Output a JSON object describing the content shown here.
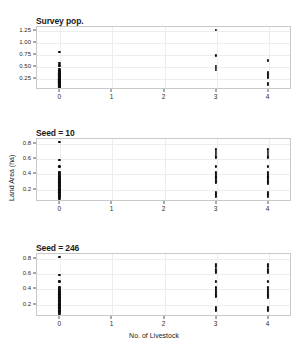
{
  "figure": {
    "xlabel": "No. of Livestock",
    "ylabel": "Land Area (ha)",
    "xticks": [
      "0",
      "1",
      "2",
      "3",
      "4"
    ],
    "background": "#ffffff",
    "point_color": "#0d0d0d",
    "grid_color": "#ededed",
    "frame_color": "#c9c9c9"
  },
  "chart_data": {
    "type": "scatter",
    "title": "",
    "xlabel": "No. of Livestock",
    "ylabel": "Land Area (ha)",
    "grid": true,
    "legend": "none",
    "xlim": [
      -0.45,
      4.45
    ],
    "xticks": [
      0,
      1,
      2,
      3,
      4
    ],
    "panels": [
      {
        "title": "Survey pop.",
        "ylim": [
          0.03,
          1.33
        ],
        "yticks": [
          0.25,
          0.5,
          0.75,
          1.0,
          1.25
        ],
        "ytick_labels": [
          "0.25",
          "0.50",
          "0.75",
          "1.00",
          "1.25"
        ],
        "points": [
          {
            "x": 0,
            "y": 0.8
          },
          {
            "x": 0,
            "y": 0.56
          },
          {
            "x": 0,
            "y": 0.53
          },
          {
            "x": 0,
            "y": 0.5
          },
          {
            "x": 0,
            "y": 0.44
          },
          {
            "x": 0,
            "y": 0.41
          },
          {
            "x": 0,
            "y": 0.4
          },
          {
            "x": 0,
            "y": 0.38
          },
          {
            "x": 0,
            "y": 0.36
          },
          {
            "x": 0,
            "y": 0.35
          },
          {
            "x": 0,
            "y": 0.34
          },
          {
            "x": 0,
            "y": 0.33
          },
          {
            "x": 0,
            "y": 0.32
          },
          {
            "x": 0,
            "y": 0.31
          },
          {
            "x": 0,
            "y": 0.3
          },
          {
            "x": 0,
            "y": 0.295
          },
          {
            "x": 0,
            "y": 0.285
          },
          {
            "x": 0,
            "y": 0.28
          },
          {
            "x": 0,
            "y": 0.27
          },
          {
            "x": 0,
            "y": 0.265
          },
          {
            "x": 0,
            "y": 0.26
          },
          {
            "x": 0,
            "y": 0.25
          },
          {
            "x": 0,
            "y": 0.245
          },
          {
            "x": 0,
            "y": 0.24
          },
          {
            "x": 0,
            "y": 0.235
          },
          {
            "x": 0,
            "y": 0.23
          },
          {
            "x": 0,
            "y": 0.225
          },
          {
            "x": 0,
            "y": 0.22
          },
          {
            "x": 0,
            "y": 0.215
          },
          {
            "x": 0,
            "y": 0.21
          },
          {
            "x": 0,
            "y": 0.205
          },
          {
            "x": 0,
            "y": 0.2
          },
          {
            "x": 0,
            "y": 0.195
          },
          {
            "x": 0,
            "y": 0.19
          },
          {
            "x": 0,
            "y": 0.185
          },
          {
            "x": 0,
            "y": 0.18
          },
          {
            "x": 0,
            "y": 0.175
          },
          {
            "x": 0,
            "y": 0.17
          },
          {
            "x": 0,
            "y": 0.165
          },
          {
            "x": 0,
            "y": 0.16
          },
          {
            "x": 0,
            "y": 0.155
          },
          {
            "x": 0,
            "y": 0.15
          },
          {
            "x": 0,
            "y": 0.145
          },
          {
            "x": 0,
            "y": 0.14
          },
          {
            "x": 0,
            "y": 0.135
          },
          {
            "x": 0,
            "y": 0.13
          },
          {
            "x": 0,
            "y": 0.125
          },
          {
            "x": 0,
            "y": 0.12
          },
          {
            "x": 0,
            "y": 0.115
          },
          {
            "x": 0,
            "y": 0.11
          },
          {
            "x": 0,
            "y": 0.105
          },
          {
            "x": 0,
            "y": 0.1
          },
          {
            "x": 0,
            "y": 0.095
          },
          {
            "x": 0,
            "y": 0.09
          },
          {
            "x": 0,
            "y": 0.085
          },
          {
            "x": 0,
            "y": 0.08
          },
          {
            "x": 0,
            "y": 0.075
          },
          {
            "x": 0,
            "y": 0.07
          },
          {
            "x": 3,
            "y": 1.25
          },
          {
            "x": 3,
            "y": 0.72
          },
          {
            "x": 3,
            "y": 0.5
          },
          {
            "x": 3,
            "y": 0.47
          },
          {
            "x": 3,
            "y": 0.42
          },
          {
            "x": 4,
            "y": 0.63
          },
          {
            "x": 4,
            "y": 0.61
          },
          {
            "x": 4,
            "y": 0.38
          },
          {
            "x": 4,
            "y": 0.36
          },
          {
            "x": 4,
            "y": 0.34
          },
          {
            "x": 4,
            "y": 0.32
          },
          {
            "x": 4,
            "y": 0.3
          },
          {
            "x": 4,
            "y": 0.28
          },
          {
            "x": 4,
            "y": 0.26
          },
          {
            "x": 4,
            "y": 0.16
          },
          {
            "x": 4,
            "y": 0.14
          },
          {
            "x": 4,
            "y": 0.12
          }
        ]
      },
      {
        "title": "Seed = 10",
        "ylim": [
          0.04,
          0.86
        ],
        "yticks": [
          0.2,
          0.4,
          0.6,
          0.8
        ],
        "ytick_labels": [
          "0.2",
          "0.4",
          "0.6",
          "0.8"
        ],
        "points": [
          {
            "x": 0,
            "y": 0.81
          },
          {
            "x": 0,
            "y": 0.57
          },
          {
            "x": 0,
            "y": 0.49
          },
          {
            "x": 0,
            "y": 0.42
          },
          {
            "x": 0,
            "y": 0.405
          },
          {
            "x": 0,
            "y": 0.39
          },
          {
            "x": 0,
            "y": 0.375
          },
          {
            "x": 0,
            "y": 0.36
          },
          {
            "x": 0,
            "y": 0.35
          },
          {
            "x": 0,
            "y": 0.34
          },
          {
            "x": 0,
            "y": 0.33
          },
          {
            "x": 0,
            "y": 0.32
          },
          {
            "x": 0,
            "y": 0.31
          },
          {
            "x": 0,
            "y": 0.3
          },
          {
            "x": 0,
            "y": 0.295
          },
          {
            "x": 0,
            "y": 0.29
          },
          {
            "x": 0,
            "y": 0.28
          },
          {
            "x": 0,
            "y": 0.27
          },
          {
            "x": 0,
            "y": 0.26
          },
          {
            "x": 0,
            "y": 0.25
          },
          {
            "x": 0,
            "y": 0.245
          },
          {
            "x": 0,
            "y": 0.24
          },
          {
            "x": 0,
            "y": 0.23
          },
          {
            "x": 0,
            "y": 0.22
          },
          {
            "x": 0,
            "y": 0.21
          },
          {
            "x": 0,
            "y": 0.2
          },
          {
            "x": 0,
            "y": 0.195
          },
          {
            "x": 0,
            "y": 0.19
          },
          {
            "x": 0,
            "y": 0.18
          },
          {
            "x": 0,
            "y": 0.17
          },
          {
            "x": 0,
            "y": 0.16
          },
          {
            "x": 0,
            "y": 0.15
          },
          {
            "x": 0,
            "y": 0.145
          },
          {
            "x": 0,
            "y": 0.14
          },
          {
            "x": 0,
            "y": 0.13
          },
          {
            "x": 0,
            "y": 0.12
          },
          {
            "x": 0,
            "y": 0.11
          },
          {
            "x": 0,
            "y": 0.1
          },
          {
            "x": 0,
            "y": 0.09
          },
          {
            "x": 0,
            "y": 0.08
          },
          {
            "x": 0,
            "y": 0.07
          },
          {
            "x": 3,
            "y": 0.71
          },
          {
            "x": 3,
            "y": 0.68
          },
          {
            "x": 3,
            "y": 0.65
          },
          {
            "x": 3,
            "y": 0.62
          },
          {
            "x": 3,
            "y": 0.6
          },
          {
            "x": 3,
            "y": 0.49
          },
          {
            "x": 3,
            "y": 0.41
          },
          {
            "x": 3,
            "y": 0.39
          },
          {
            "x": 3,
            "y": 0.375
          },
          {
            "x": 3,
            "y": 0.36
          },
          {
            "x": 3,
            "y": 0.345
          },
          {
            "x": 3,
            "y": 0.33
          },
          {
            "x": 3,
            "y": 0.315
          },
          {
            "x": 3,
            "y": 0.3
          },
          {
            "x": 3,
            "y": 0.29
          },
          {
            "x": 3,
            "y": 0.28
          },
          {
            "x": 3,
            "y": 0.155
          },
          {
            "x": 3,
            "y": 0.14
          },
          {
            "x": 3,
            "y": 0.125
          },
          {
            "x": 3,
            "y": 0.11
          },
          {
            "x": 3,
            "y": 0.095
          },
          {
            "x": 4,
            "y": 0.71
          },
          {
            "x": 4,
            "y": 0.68
          },
          {
            "x": 4,
            "y": 0.65
          },
          {
            "x": 4,
            "y": 0.62
          },
          {
            "x": 4,
            "y": 0.6
          },
          {
            "x": 4,
            "y": 0.49
          },
          {
            "x": 4,
            "y": 0.41
          },
          {
            "x": 4,
            "y": 0.39
          },
          {
            "x": 4,
            "y": 0.375
          },
          {
            "x": 4,
            "y": 0.36
          },
          {
            "x": 4,
            "y": 0.345
          },
          {
            "x": 4,
            "y": 0.33
          },
          {
            "x": 4,
            "y": 0.315
          },
          {
            "x": 4,
            "y": 0.3
          },
          {
            "x": 4,
            "y": 0.29
          },
          {
            "x": 4,
            "y": 0.28
          },
          {
            "x": 4,
            "y": 0.265
          },
          {
            "x": 4,
            "y": 0.155
          },
          {
            "x": 4,
            "y": 0.14
          },
          {
            "x": 4,
            "y": 0.125
          },
          {
            "x": 4,
            "y": 0.11
          },
          {
            "x": 4,
            "y": 0.095
          }
        ]
      },
      {
        "title": "Seed = 246",
        "ylim": [
          0.04,
          0.86
        ],
        "yticks": [
          0.2,
          0.4,
          0.6,
          0.8
        ],
        "ytick_labels": [
          "0.2",
          "0.4",
          "0.6",
          "0.8"
        ],
        "points": [
          {
            "x": 0,
            "y": 0.81
          },
          {
            "x": 0,
            "y": 0.57
          },
          {
            "x": 0,
            "y": 0.49
          },
          {
            "x": 0,
            "y": 0.42
          },
          {
            "x": 0,
            "y": 0.405
          },
          {
            "x": 0,
            "y": 0.39
          },
          {
            "x": 0,
            "y": 0.375
          },
          {
            "x": 0,
            "y": 0.36
          },
          {
            "x": 0,
            "y": 0.35
          },
          {
            "x": 0,
            "y": 0.34
          },
          {
            "x": 0,
            "y": 0.33
          },
          {
            "x": 0,
            "y": 0.32
          },
          {
            "x": 0,
            "y": 0.31
          },
          {
            "x": 0,
            "y": 0.3
          },
          {
            "x": 0,
            "y": 0.295
          },
          {
            "x": 0,
            "y": 0.29
          },
          {
            "x": 0,
            "y": 0.28
          },
          {
            "x": 0,
            "y": 0.27
          },
          {
            "x": 0,
            "y": 0.26
          },
          {
            "x": 0,
            "y": 0.25
          },
          {
            "x": 0,
            "y": 0.245
          },
          {
            "x": 0,
            "y": 0.24
          },
          {
            "x": 0,
            "y": 0.23
          },
          {
            "x": 0,
            "y": 0.22
          },
          {
            "x": 0,
            "y": 0.21
          },
          {
            "x": 0,
            "y": 0.2
          },
          {
            "x": 0,
            "y": 0.195
          },
          {
            "x": 0,
            "y": 0.19
          },
          {
            "x": 0,
            "y": 0.18
          },
          {
            "x": 0,
            "y": 0.17
          },
          {
            "x": 0,
            "y": 0.16
          },
          {
            "x": 0,
            "y": 0.15
          },
          {
            "x": 0,
            "y": 0.145
          },
          {
            "x": 0,
            "y": 0.14
          },
          {
            "x": 0,
            "y": 0.13
          },
          {
            "x": 0,
            "y": 0.12
          },
          {
            "x": 0,
            "y": 0.11
          },
          {
            "x": 0,
            "y": 0.1
          },
          {
            "x": 0,
            "y": 0.09
          },
          {
            "x": 0,
            "y": 0.08
          },
          {
            "x": 0,
            "y": 0.07
          },
          {
            "x": 3,
            "y": 0.71
          },
          {
            "x": 3,
            "y": 0.685
          },
          {
            "x": 3,
            "y": 0.645
          },
          {
            "x": 3,
            "y": 0.62
          },
          {
            "x": 3,
            "y": 0.6
          },
          {
            "x": 3,
            "y": 0.49
          },
          {
            "x": 3,
            "y": 0.41
          },
          {
            "x": 3,
            "y": 0.395
          },
          {
            "x": 3,
            "y": 0.38
          },
          {
            "x": 3,
            "y": 0.365
          },
          {
            "x": 3,
            "y": 0.35
          },
          {
            "x": 3,
            "y": 0.335
          },
          {
            "x": 3,
            "y": 0.32
          },
          {
            "x": 3,
            "y": 0.305
          },
          {
            "x": 3,
            "y": 0.295
          },
          {
            "x": 3,
            "y": 0.285
          },
          {
            "x": 3,
            "y": 0.155
          },
          {
            "x": 3,
            "y": 0.14
          },
          {
            "x": 3,
            "y": 0.125
          },
          {
            "x": 3,
            "y": 0.11
          },
          {
            "x": 4,
            "y": 0.71
          },
          {
            "x": 4,
            "y": 0.685
          },
          {
            "x": 4,
            "y": 0.645
          },
          {
            "x": 4,
            "y": 0.62
          },
          {
            "x": 4,
            "y": 0.6
          },
          {
            "x": 4,
            "y": 0.49
          },
          {
            "x": 4,
            "y": 0.41
          },
          {
            "x": 4,
            "y": 0.395
          },
          {
            "x": 4,
            "y": 0.38
          },
          {
            "x": 4,
            "y": 0.365
          },
          {
            "x": 4,
            "y": 0.35
          },
          {
            "x": 4,
            "y": 0.335
          },
          {
            "x": 4,
            "y": 0.32
          },
          {
            "x": 4,
            "y": 0.305
          },
          {
            "x": 4,
            "y": 0.295
          },
          {
            "x": 4,
            "y": 0.285
          },
          {
            "x": 4,
            "y": 0.27
          },
          {
            "x": 4,
            "y": 0.155
          },
          {
            "x": 4,
            "y": 0.14
          },
          {
            "x": 4,
            "y": 0.125
          },
          {
            "x": 4,
            "y": 0.11
          }
        ]
      }
    ]
  }
}
